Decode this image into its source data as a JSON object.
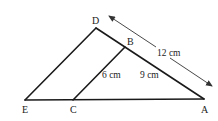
{
  "diagram": {
    "points": {
      "D": {
        "label": "D"
      },
      "B": {
        "label": "B"
      },
      "E": {
        "label": "E"
      },
      "C": {
        "label": "C"
      },
      "A": {
        "label": "A"
      }
    },
    "measurements": {
      "DA": "12 cm",
      "BC": "6 cm",
      "BA": "9 cm"
    }
  }
}
